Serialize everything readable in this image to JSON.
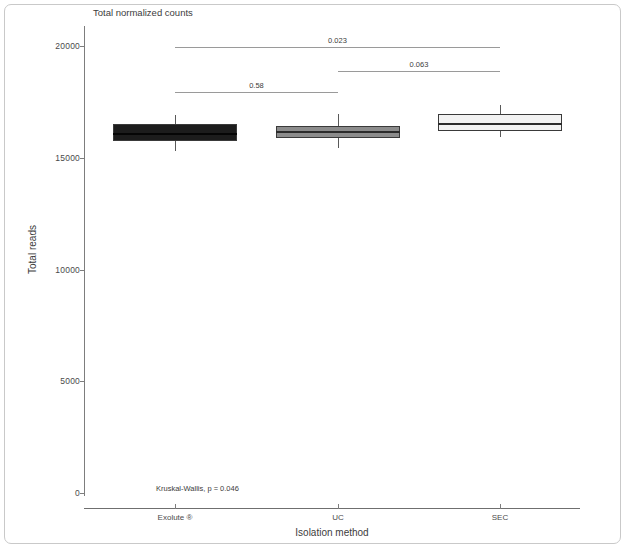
{
  "figure": {
    "title": "Total normalized counts",
    "stat_annotation": "Kruskal-Wallis, p = 0.046"
  },
  "axes": {
    "x_title": "Isolation method",
    "y_title": "Total reads",
    "y_ticks": [
      "0",
      "5000",
      "10000",
      "15000",
      "20000"
    ],
    "x_ticks": [
      "Exolute ®",
      "UC",
      "SEC"
    ]
  },
  "annotations": [
    {
      "label": "0.023",
      "from": "Exolute ®",
      "to": "SEC"
    },
    {
      "label": "0.063",
      "from": "UC",
      "to": "SEC"
    },
    {
      "label": "0.58",
      "from": "Exolute ®",
      "to": "UC"
    }
  ],
  "colors": {
    "box_exolute_fill": "#1c1c1c",
    "box_uc_fill": "#8c8c8c",
    "box_sec_fill": "#f2f2f2",
    "box_stroke": "#3a3a3a",
    "axis": "#7d7d7d",
    "bracket": "#9a9a9a",
    "text": "#3c3c3c"
  },
  "chart_data": {
    "type": "box",
    "title": "Total normalized counts",
    "xlabel": "Isolation method",
    "ylabel": "Total reads",
    "ylim": [
      0,
      21000
    ],
    "yticks": [
      0,
      5000,
      10000,
      15000,
      20000
    ],
    "grid": false,
    "legend": null,
    "categories": [
      "Exolute ®",
      "UC",
      "SEC"
    ],
    "boxes": [
      {
        "category": "Exolute ®",
        "whisker_low": 15300,
        "q1": 15750,
        "median": 16100,
        "q3": 16510,
        "whisker_high": 16900,
        "fill": "#1c1c1c"
      },
      {
        "category": "UC",
        "whisker_low": 15450,
        "q1": 15880,
        "median": 16200,
        "q3": 16400,
        "whisker_high": 16950,
        "fill": "#8c8c8c"
      },
      {
        "category": "SEC",
        "whisker_low": 15950,
        "q1": 16200,
        "median": 16550,
        "q3": 16960,
        "whisker_high": 17350,
        "fill": "#f2f2f2"
      }
    ],
    "pairwise_comparisons": [
      {
        "group1": "Exolute ®",
        "group2": "SEC",
        "p_value": 0.023
      },
      {
        "group1": "UC",
        "group2": "SEC",
        "p_value": 0.063
      },
      {
        "group1": "Exolute ®",
        "group2": "UC",
        "p_value": 0.58
      }
    ],
    "omnibus_test": {
      "name": "Kruskal-Wallis",
      "p_value": 0.046,
      "text": "Kruskal-Wallis, p = 0.046"
    }
  }
}
